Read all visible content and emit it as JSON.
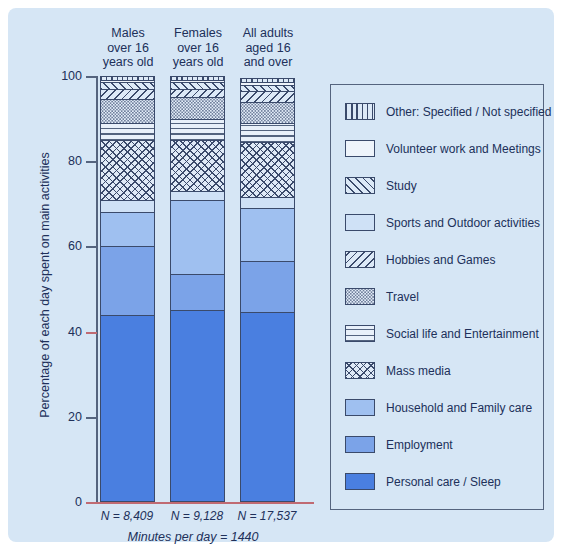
{
  "figure": {
    "background_color": "#d6e6f5",
    "axis_color": "#55647e",
    "accent_color": "#c06a72"
  },
  "y_axis": {
    "title": "Percentage of each day spent on main activities",
    "ticks": [
      "100",
      "80",
      "60",
      "40",
      "20",
      "0"
    ]
  },
  "columns": [
    {
      "header": "Males\nover 16\nyears old",
      "n_label": "N = 8,409"
    },
    {
      "header": "Females\nover 16\nyears old",
      "n_label": "N = 9,128"
    },
    {
      "header": "All adults\naged 16\nand over",
      "n_label": "N = 17,537"
    }
  ],
  "caption": "Minutes per day = 1440",
  "legend": {
    "items": [
      {
        "label": "Other: Specified / Not specified",
        "pattern": "vertical-stripes",
        "color": "#dce9f7"
      },
      {
        "label": "Volunteer work and Meetings",
        "pattern": "sparse-dots",
        "color": "#eef4fb"
      },
      {
        "label": "Study",
        "pattern": "diagonal-hatch-up",
        "color": "#dce9f7"
      },
      {
        "label": "Sports and Outdoor activities",
        "pattern": "solid",
        "color": "#cfe1f6"
      },
      {
        "label": "Hobbies and Games",
        "pattern": "diagonal-hatch-down",
        "color": "#dce9f7"
      },
      {
        "label": "Travel",
        "pattern": "fine-dots",
        "color": "#e4eefa"
      },
      {
        "label": "Social life and Entertainment",
        "pattern": "horizontal-stripes",
        "color": "#e8f0fa"
      },
      {
        "label": "Mass media",
        "pattern": "cross-hatch",
        "color": "#dfeaf7"
      },
      {
        "label": "Household and Family care",
        "pattern": "solid",
        "color": "#9fc0f0"
      },
      {
        "label": "Employment",
        "pattern": "solid",
        "color": "#7ba3e8"
      },
      {
        "label": "Personal care / Sleep",
        "pattern": "solid",
        "color": "#4a7fe0"
      }
    ]
  },
  "chart_data": {
    "type": "bar",
    "subtype": "stacked-100-percent",
    "title": "",
    "xlabel": "",
    "ylabel": "Percentage of each day spent on main activities",
    "ylim": [
      0,
      100
    ],
    "yticks": [
      0,
      20,
      40,
      60,
      80,
      100
    ],
    "grid": false,
    "legend_position": "right",
    "categories": [
      "Males over 16 years old",
      "Females over 16 years old",
      "All adults aged 16 and over"
    ],
    "sample_sizes": [
      8409,
      9128,
      17537
    ],
    "minutes_per_day": 1440,
    "series": [
      {
        "name": "Personal care / Sleep",
        "values": [
          44.0,
          45.0,
          44.5
        ]
      },
      {
        "name": "Employment",
        "values": [
          16.0,
          8.5,
          12.0
        ]
      },
      {
        "name": "Household and Family care",
        "values": [
          8.0,
          17.5,
          12.5
        ]
      },
      {
        "name": "Sports and Outdoor activities",
        "values": [
          3.0,
          2.0,
          2.5
        ]
      },
      {
        "name": "Mass media",
        "values": [
          14.0,
          12.0,
          13.0
        ]
      },
      {
        "name": "Social life and Entertainment",
        "values": [
          4.0,
          5.0,
          4.5
        ]
      },
      {
        "name": "Travel",
        "values": [
          5.5,
          5.0,
          5.0
        ]
      },
      {
        "name": "Hobbies and Games",
        "values": [
          2.5,
          2.0,
          2.5
        ]
      },
      {
        "name": "Study",
        "values": [
          1.5,
          1.5,
          1.5
        ]
      },
      {
        "name": "Volunteer work and Meetings",
        "values": [
          0.5,
          0.5,
          0.5
        ]
      },
      {
        "name": "Other: Specified / Not specified",
        "values": [
          1.0,
          1.0,
          1.0
        ]
      }
    ]
  }
}
